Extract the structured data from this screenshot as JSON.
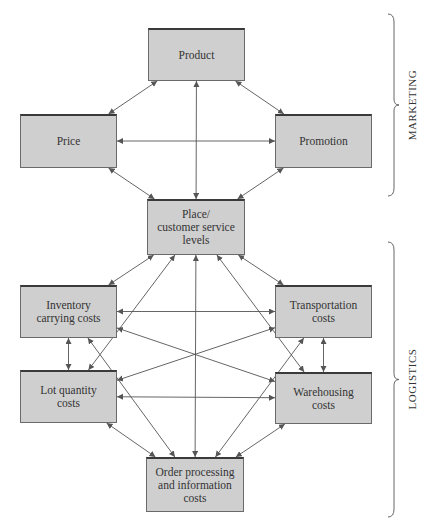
{
  "nodes": [
    {
      "id": "product",
      "label": "Product",
      "x": 148,
      "y": 28,
      "w": 97,
      "h": 53
    },
    {
      "id": "price",
      "label": "Price",
      "x": 20,
      "y": 114,
      "w": 97,
      "h": 54
    },
    {
      "id": "promotion",
      "label": "Promotion",
      "x": 275,
      "y": 114,
      "w": 97,
      "h": 54
    },
    {
      "id": "place",
      "label": "Place/\ncustomer service\nlevels",
      "x": 147,
      "y": 199,
      "w": 98,
      "h": 56
    },
    {
      "id": "inventory",
      "label": "Inventory\ncarrying costs",
      "x": 20,
      "y": 285,
      "w": 97,
      "h": 53
    },
    {
      "id": "transportation",
      "label": "Transportation\ncosts",
      "x": 275,
      "y": 285,
      "w": 97,
      "h": 53
    },
    {
      "id": "lot_quantity",
      "label": "Lot quantity\ncosts",
      "x": 20,
      "y": 370,
      "w": 97,
      "h": 53
    },
    {
      "id": "warehousing",
      "label": "Warehousing\ncosts",
      "x": 275,
      "y": 372,
      "w": 97,
      "h": 52
    },
    {
      "id": "order_processing",
      "label": "Order processing\nand information\ncosts",
      "x": 146,
      "y": 457,
      "w": 98,
      "h": 55
    }
  ],
  "groups": [
    {
      "label": "MARKETING",
      "y_top": 14,
      "y_bottom": 196
    },
    {
      "label": "LOGISTICS",
      "y_top": 242,
      "y_bottom": 517
    }
  ],
  "edges": [
    [
      "product",
      "price"
    ],
    [
      "product",
      "promotion"
    ],
    [
      "product",
      "place"
    ],
    [
      "price",
      "promotion"
    ],
    [
      "price",
      "place"
    ],
    [
      "promotion",
      "place"
    ],
    [
      "place",
      "inventory"
    ],
    [
      "place",
      "transportation"
    ],
    [
      "place",
      "lot_quantity"
    ],
    [
      "place",
      "warehousing"
    ],
    [
      "place",
      "order_processing"
    ],
    [
      "inventory",
      "transportation"
    ],
    [
      "inventory",
      "warehousing"
    ],
    [
      "inventory",
      "lot_quantity"
    ],
    [
      "inventory",
      "order_processing"
    ],
    [
      "lot_quantity",
      "transportation"
    ],
    [
      "lot_quantity",
      "warehousing"
    ],
    [
      "lot_quantity",
      "order_processing"
    ],
    [
      "transportation",
      "warehousing"
    ],
    [
      "transportation",
      "order_processing"
    ],
    [
      "warehousing",
      "order_processing"
    ]
  ],
  "colors": {
    "box_fill": "#cfcfcf",
    "box_border": "#6a6a6a",
    "line": "#555555"
  }
}
